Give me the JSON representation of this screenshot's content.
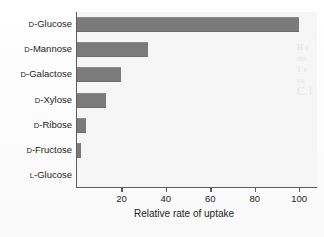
{
  "chart_data": {
    "type": "bar",
    "orientation": "horizontal",
    "title": "",
    "xlabel": "Relative rate of uptake",
    "ylabel": "",
    "categories": [
      "D-Glucose",
      "D-Mannose",
      "D-Galactose",
      "D-Xylose",
      "D-Ribose",
      "D-Fructose",
      "L-Glucose"
    ],
    "category_parts": [
      {
        "prefix": "D",
        "name": "-Glucose"
      },
      {
        "prefix": "D",
        "name": "-Mannose"
      },
      {
        "prefix": "D",
        "name": "-Galactose"
      },
      {
        "prefix": "D",
        "name": "-Xylose"
      },
      {
        "prefix": "D",
        "name": "-Ribose"
      },
      {
        "prefix": "D",
        "name": "-Fructose"
      },
      {
        "prefix": "L",
        "name": "-Glucose"
      }
    ],
    "values": [
      100,
      32,
      20,
      13,
      4,
      2,
      0
    ],
    "xlim": [
      0,
      108
    ],
    "xticks": [
      20,
      40,
      60,
      80,
      100
    ],
    "xtick_labels": [
      "20",
      "40",
      "60",
      "80",
      "100"
    ],
    "grid": false,
    "legend": null,
    "bar_color": "#7b7b7b",
    "plot_background": "#f6f6f6",
    "axis_color": "#5d5d5d"
  },
  "artifacts": {
    "margin_bleed_lines": [
      "H t",
      "ou",
      "1 s",
      "ro",
      "C l"
    ]
  }
}
